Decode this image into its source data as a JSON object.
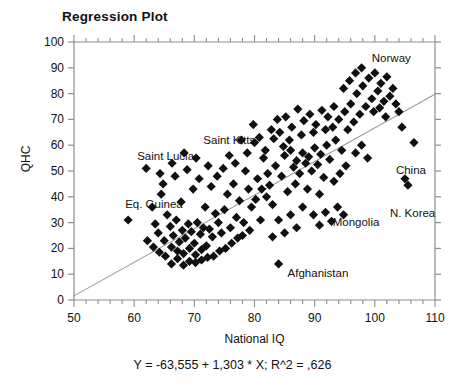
{
  "chart_data": {
    "type": "scatter",
    "title": "Regression Plot",
    "xlabel": "National IQ",
    "ylabel": "QHC",
    "equation": "Y = -63,555 + 1,303 * X; R^2 = ,626",
    "slope": 1.303,
    "intercept": -63.555,
    "r_squared": 0.626,
    "grid": false,
    "legend": "none",
    "xlim": [
      50,
      110
    ],
    "ylim": [
      0,
      100
    ],
    "xticks": [
      50,
      60,
      70,
      80,
      90,
      100,
      110
    ],
    "yticks": [
      0,
      10,
      20,
      30,
      40,
      50,
      60,
      70,
      80,
      90,
      100
    ],
    "x_minor_tick_step": 2,
    "y_minor_tick_step": 10,
    "marker": "diamond",
    "marker_color": "#101010",
    "line_color": "#999999",
    "annotations": [
      {
        "label": "Norway",
        "x": 99.5,
        "y": 93.5
      },
      {
        "label": "Saint Kitts",
        "x": 71.5,
        "y": 61.5
      },
      {
        "label": "Saint Lucia",
        "x": 60.5,
        "y": 55.5
      },
      {
        "label": "Eq. Guinea",
        "x": 58.5,
        "y": 37.0
      },
      {
        "label": "China",
        "x": 103.5,
        "y": 50.0
      },
      {
        "label": "N. Korea",
        "x": 102.5,
        "y": 33.5
      },
      {
        "label": "Mongolia",
        "x": 93.0,
        "y": 30.0
      },
      {
        "label": "Afghanistan",
        "x": 85.5,
        "y": 10.0
      }
    ],
    "points": [
      [
        59.0,
        31.0
      ],
      [
        62.0,
        51.0
      ],
      [
        64.5,
        41.0
      ],
      [
        63.0,
        36.0
      ],
      [
        65.5,
        33.0
      ],
      [
        63.5,
        29.5
      ],
      [
        64.0,
        26.0
      ],
      [
        65.0,
        23.0
      ],
      [
        66.0,
        28.5
      ],
      [
        66.5,
        25.0
      ],
      [
        67.0,
        31.0
      ],
      [
        67.5,
        22.5
      ],
      [
        68.0,
        27.0
      ],
      [
        68.5,
        24.0
      ],
      [
        69.0,
        29.5
      ],
      [
        69.5,
        26.5
      ],
      [
        70.0,
        22.0
      ],
      [
        70.5,
        30.0
      ],
      [
        71.0,
        25.5
      ],
      [
        71.5,
        28.0
      ],
      [
        66.2,
        20.5
      ],
      [
        67.2,
        19.0
      ],
      [
        68.2,
        18.0
      ],
      [
        69.2,
        20.0
      ],
      [
        70.2,
        17.5
      ],
      [
        71.2,
        19.5
      ],
      [
        72.0,
        21.0
      ],
      [
        72.5,
        27.5
      ],
      [
        73.0,
        24.5
      ],
      [
        64.8,
        45.0
      ],
      [
        66.8,
        48.0
      ],
      [
        68.8,
        50.5
      ],
      [
        70.8,
        47.0
      ],
      [
        72.8,
        44.0
      ],
      [
        69.8,
        43.0
      ],
      [
        67.8,
        38.0
      ],
      [
        71.8,
        36.0
      ],
      [
        73.5,
        33.5
      ],
      [
        74.0,
        30.0
      ],
      [
        74.5,
        26.0
      ],
      [
        75.0,
        35.0
      ],
      [
        75.5,
        41.0
      ],
      [
        76.0,
        28.0
      ],
      [
        76.5,
        45.0
      ],
      [
        77.0,
        32.0
      ],
      [
        77.5,
        38.5
      ],
      [
        78.0,
        25.0
      ],
      [
        78.5,
        50.0
      ],
      [
        79.0,
        43.0
      ],
      [
        79.5,
        36.0
      ],
      [
        80.0,
        61.0
      ],
      [
        80.5,
        47.0
      ],
      [
        81.0,
        31.0
      ],
      [
        81.5,
        55.0
      ],
      [
        82.0,
        40.0
      ],
      [
        82.5,
        44.5
      ],
      [
        83.0,
        37.0
      ],
      [
        83.5,
        52.0
      ],
      [
        84.0,
        14.0
      ],
      [
        84.5,
        48.0
      ],
      [
        85.0,
        56.0
      ],
      [
        85.5,
        42.0
      ],
      [
        86.0,
        58.0
      ],
      [
        86.5,
        51.5
      ],
      [
        87.0,
        54.0
      ],
      [
        87.5,
        49.0
      ],
      [
        88.0,
        57.0
      ],
      [
        88.5,
        53.0
      ],
      [
        89.0,
        55.5
      ],
      [
        89.5,
        50.0
      ],
      [
        90.0,
        59.0
      ],
      [
        90.5,
        52.5
      ],
      [
        91.0,
        56.5
      ],
      [
        91.5,
        47.5
      ],
      [
        92.0,
        60.0
      ],
      [
        92.5,
        54.5
      ],
      [
        84.8,
        59.5
      ],
      [
        85.8,
        62.0
      ],
      [
        86.8,
        45.0
      ],
      [
        87.8,
        64.0
      ],
      [
        88.8,
        43.0
      ],
      [
        89.8,
        65.0
      ],
      [
        90.8,
        41.0
      ],
      [
        91.8,
        66.0
      ],
      [
        82.8,
        66.0
      ],
      [
        83.8,
        70.0
      ],
      [
        81.8,
        58.0
      ],
      [
        80.8,
        63.0
      ],
      [
        79.8,
        68.0
      ],
      [
        78.8,
        57.0
      ],
      [
        77.8,
        62.0
      ],
      [
        76.8,
        53.0
      ],
      [
        75.8,
        56.0
      ],
      [
        74.8,
        51.0
      ],
      [
        73.8,
        48.0
      ],
      [
        72.3,
        52.0
      ],
      [
        70.3,
        55.0
      ],
      [
        68.3,
        57.0
      ],
      [
        66.3,
        53.0
      ],
      [
        64.3,
        49.0
      ],
      [
        93.0,
        67.0
      ],
      [
        93.5,
        62.0
      ],
      [
        94.0,
        70.0
      ],
      [
        94.5,
        58.0
      ],
      [
        95.0,
        73.0
      ],
      [
        95.5,
        66.0
      ],
      [
        96.0,
        76.0
      ],
      [
        96.5,
        69.0
      ],
      [
        97.0,
        80.0
      ],
      [
        97.5,
        72.0
      ],
      [
        98.0,
        83.0
      ],
      [
        98.5,
        75.0
      ],
      [
        99.0,
        86.0
      ],
      [
        99.5,
        78.0
      ],
      [
        100.0,
        88.0
      ],
      [
        100.5,
        81.0
      ],
      [
        101.0,
        84.0
      ],
      [
        101.5,
        77.0
      ],
      [
        102.0,
        86.5
      ],
      [
        102.5,
        79.0
      ],
      [
        96.8,
        88.0
      ],
      [
        97.8,
        90.0
      ],
      [
        95.8,
        85.0
      ],
      [
        94.8,
        82.0
      ],
      [
        99.8,
        73.0
      ],
      [
        100.8,
        74.5
      ],
      [
        101.8,
        71.0
      ],
      [
        103.0,
        82.0
      ],
      [
        103.5,
        76.0
      ],
      [
        104.0,
        73.0
      ],
      [
        105.0,
        47.0
      ],
      [
        105.5,
        44.5
      ],
      [
        106.5,
        61.0
      ],
      [
        104.5,
        67.0
      ],
      [
        93.2,
        75.0
      ],
      [
        92.2,
        71.0
      ],
      [
        91.2,
        73.5
      ],
      [
        90.2,
        68.0
      ],
      [
        89.2,
        72.0
      ],
      [
        88.2,
        69.5
      ],
      [
        87.2,
        74.0
      ],
      [
        86.2,
        67.0
      ],
      [
        85.2,
        71.0
      ],
      [
        84.2,
        65.0
      ],
      [
        83.2,
        62.5
      ],
      [
        82.2,
        49.0
      ],
      [
        81.2,
        43.0
      ],
      [
        80.2,
        39.0
      ],
      [
        93.8,
        36.0
      ],
      [
        94.8,
        33.0
      ],
      [
        92.8,
        30.5
      ],
      [
        91.8,
        34.0
      ],
      [
        90.8,
        29.0
      ],
      [
        89.8,
        33.0
      ],
      [
        96.8,
        57.0
      ],
      [
        97.8,
        60.0
      ],
      [
        98.8,
        55.0
      ],
      [
        95.2,
        52.0
      ],
      [
        94.2,
        49.0
      ],
      [
        93.2,
        46.0
      ],
      [
        78.2,
        30.0
      ],
      [
        79.2,
        27.0
      ],
      [
        77.2,
        24.0
      ],
      [
        76.2,
        22.0
      ],
      [
        75.2,
        20.0
      ],
      [
        74.2,
        19.0
      ],
      [
        73.2,
        17.0
      ],
      [
        72.2,
        16.5
      ],
      [
        71.2,
        15.5
      ],
      [
        70.2,
        14.5
      ],
      [
        69.2,
        15.0
      ],
      [
        68.2,
        13.5
      ],
      [
        67.2,
        16.0
      ],
      [
        66.2,
        14.0
      ],
      [
        65.2,
        17.0
      ],
      [
        64.2,
        18.5
      ],
      [
        63.2,
        20.5
      ],
      [
        62.2,
        23.0
      ],
      [
        88.0,
        36.0
      ],
      [
        86.0,
        33.0
      ],
      [
        84.0,
        31.0
      ],
      [
        87.0,
        28.0
      ],
      [
        85.0,
        26.0
      ],
      [
        83.0,
        24.5
      ]
    ]
  }
}
